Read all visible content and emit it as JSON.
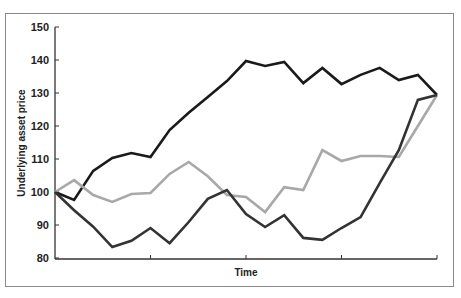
{
  "chart_data": {
    "type": "line",
    "title": "",
    "xlabel": "Time",
    "ylabel": "Underlying asset price",
    "ylim": [
      80,
      150
    ],
    "yticks": [
      80,
      90,
      100,
      110,
      120,
      130,
      140,
      150
    ],
    "grid": false,
    "legend": null,
    "x": [
      0,
      1,
      2,
      3,
      4,
      5,
      6,
      7,
      8,
      9,
      10,
      11,
      12,
      13,
      14,
      15,
      16,
      17,
      18,
      19,
      20
    ],
    "series": [
      {
        "name": "path-black",
        "color": "#1a1a1a",
        "values": [
          100,
          97.6,
          106.4,
          110.3,
          111.8,
          110.6,
          118.8,
          124.0,
          128.8,
          133.6,
          139.7,
          138.2,
          139.4,
          133.0,
          137.6,
          132.7,
          135.5,
          137.6,
          133.9,
          135.5,
          129.4
        ]
      },
      {
        "name": "path-gray",
        "color": "#a8a8a8",
        "values": [
          100,
          103.6,
          99.1,
          97.0,
          99.4,
          99.7,
          105.5,
          109.1,
          104.8,
          99.1,
          98.5,
          93.9,
          101.5,
          100.6,
          112.7,
          109.4,
          110.9,
          110.9,
          110.6,
          120.0,
          129.4
        ]
      },
      {
        "name": "path-dark",
        "color": "#333333",
        "values": [
          100,
          94.5,
          89.5,
          83.3,
          85.2,
          89.1,
          84.5,
          90.9,
          97.9,
          100.6,
          93.3,
          89.4,
          93.0,
          86.1,
          85.5,
          89.1,
          92.4,
          102.7,
          112.7,
          127.9,
          129.4
        ]
      }
    ]
  },
  "axes": {
    "x_title": "Time",
    "y_title": "Underlying asset price",
    "y_tick_labels": [
      "150",
      "140",
      "130",
      "120",
      "110",
      "100",
      "90",
      "80"
    ]
  }
}
